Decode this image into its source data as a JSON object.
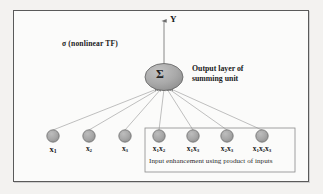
{
  "figure": {
    "background_color": "#f3f2f0",
    "panel_color": "#fbfbfa",
    "frame_color": "#5a5a5a",
    "node_fill": "#a6a6a6",
    "node_stroke": "#6f6f6f",
    "edge_color": "#9a9a9a",
    "text_color": "#1a1a1a"
  },
  "output": {
    "arrow_label": "Y",
    "transfer_function_label": "σ (nonlinear TF)",
    "summing_unit_glyph": "Σ",
    "layer_label": "Output layer of summing unit"
  },
  "input_layer": {
    "nodes": [
      {
        "id": "x1",
        "label_html": "x<sub>1</sub>",
        "label_text": "x1",
        "cx": 53,
        "cy": 136,
        "emphasized": true,
        "in_box": false
      },
      {
        "id": "x2",
        "label_html": "x<sub>2</sub>",
        "label_text": "x2",
        "cx": 89,
        "cy": 136,
        "emphasized": false,
        "in_box": false
      },
      {
        "id": "x3",
        "label_html": "x<sub>3</sub>",
        "label_text": "x3",
        "cx": 125,
        "cy": 136,
        "emphasized": false,
        "in_box": false
      },
      {
        "id": "x1x2",
        "label_html": "x<sub>1</sub>x<sub>2</sub>",
        "label_text": "x1x2",
        "cx": 159,
        "cy": 136,
        "emphasized": false,
        "in_box": true
      },
      {
        "id": "x1x3",
        "label_html": "x<sub>1</sub>x<sub>3</sub>",
        "label_text": "x1x3",
        "cx": 193,
        "cy": 136,
        "emphasized": false,
        "in_box": true
      },
      {
        "id": "x2x3",
        "label_html": "x<sub>2</sub>x<sub>3</sub>",
        "label_text": "x2x3",
        "cx": 227,
        "cy": 136,
        "emphasized": false,
        "in_box": true
      },
      {
        "id": "x1x2x3",
        "label_html": "x<sub>1</sub>x<sub>2</sub>x<sub>3</sub>",
        "label_text": "x1x2x3",
        "cx": 262,
        "cy": 136,
        "emphasized": false,
        "in_box": true
      }
    ],
    "node_radius": 6.2
  },
  "enhancement_box": {
    "caption": "Input enhancement using product of inputs",
    "x": 145,
    "y": 128,
    "width": 150,
    "height": 44
  },
  "summing_unit": {
    "cx": 164,
    "cy": 77,
    "rx": 19,
    "ry": 13.5
  }
}
